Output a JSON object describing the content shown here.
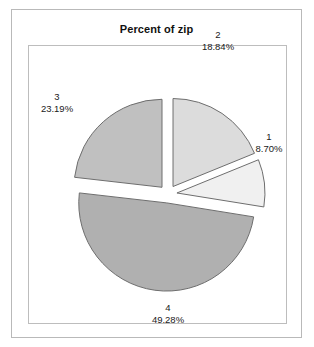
{
  "chart_data": {
    "type": "pie",
    "title": "Percent of zip",
    "xlabel": "",
    "ylabel": "",
    "exploded": true,
    "legend": "none",
    "grid": false,
    "categories": [
      "1",
      "2",
      "3",
      "4"
    ],
    "values": [
      8.7,
      18.84,
      23.19,
      49.28
    ],
    "value_unit": "%",
    "slices": [
      {
        "name": "1",
        "percent_label": "8.70%",
        "value": 8.7,
        "color": "#f0f0f0",
        "start_angle": 67.82,
        "end_angle": 99.14
      },
      {
        "name": "2",
        "percent_label": "18.84%",
        "value": 18.84,
        "color": "#dcdcdc",
        "start_angle": 0.0,
        "end_angle": 67.82
      },
      {
        "name": "3",
        "percent_label": "23.19%",
        "value": 23.19,
        "color": "#c0c0c0",
        "start_angle": 276.52,
        "end_angle": 360.0
      },
      {
        "name": "4",
        "percent_label": "49.28%",
        "value": 49.28,
        "color": "#b0b0b0",
        "start_angle": 99.14,
        "end_angle": 276.52
      }
    ],
    "total_percent": "100.01%"
  },
  "chart": {
    "title": "Percent of zip",
    "labels": {
      "slice1_name": "1",
      "slice1_pct": "8.70%",
      "slice2_name": "2",
      "slice2_pct": "18.84%",
      "slice3_name": "3",
      "slice3_pct": "23.19%",
      "slice4_name": "4",
      "slice4_pct": "49.28%"
    },
    "colors": {
      "slice1": "#f0f0f0",
      "slice2": "#dcdcdc",
      "slice3": "#c0c0c0",
      "slice4": "#b0b0b0",
      "outline": "#6e6e6e",
      "frame": "#b9b9b9",
      "plot_frame": "#bdbdbd",
      "background": "#ffffff",
      "text": "#1a1a1a"
    }
  }
}
